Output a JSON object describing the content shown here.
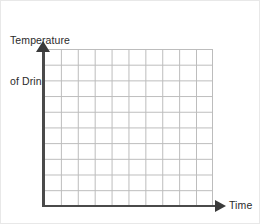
{
  "chart_data": {
    "type": "line",
    "title": "",
    "ylabel": "Temperature of Drink (°F)",
    "ylabel_line1": "Temperature",
    "ylabel_line2": "of Drink (°F)",
    "xlabel": "Time",
    "categories": [],
    "values": [],
    "series": [],
    "xticklabels": [],
    "yticklabels": [],
    "grid": true,
    "grid_columns": 10,
    "grid_rows": 10,
    "legend": false,
    "legend_position": "none",
    "annotations": [],
    "colors": {
      "axis": "#4a4a4a",
      "arrow": "#3a3a3a",
      "gridline": "#bcbcbc",
      "text": "#2b2b2b",
      "background": "#ffffff"
    }
  },
  "axes": {
    "y": {
      "label_line1": "Temperature",
      "label_line2": "of Drink (°F)",
      "arrow_icon": "arrow-up-icon"
    },
    "x": {
      "label": "Time",
      "arrow_icon": "arrow-right-icon"
    }
  }
}
